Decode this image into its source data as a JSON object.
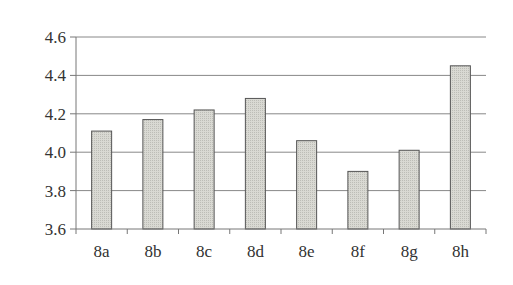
{
  "chart_data": {
    "type": "bar",
    "title": "",
    "xlabel": "",
    "ylabel": "",
    "categories": [
      "8a",
      "8b",
      "8c",
      "8d",
      "8e",
      "8f",
      "8g",
      "8h"
    ],
    "values": [
      4.11,
      4.17,
      4.22,
      4.28,
      4.06,
      3.9,
      4.01,
      4.45
    ],
    "ylim": [
      3.6,
      4.6
    ],
    "yticks": [
      "3.6",
      "3.8",
      "4.0",
      "4.2",
      "4.4",
      "4.6"
    ],
    "grid": true,
    "legend": null,
    "bar_color": "#d4d4ce",
    "bar_edge_color": "#555555",
    "grid_color": "#888888"
  }
}
